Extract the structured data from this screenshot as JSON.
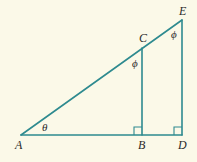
{
  "diagram": {
    "points": {
      "A": {
        "label": "A"
      },
      "B": {
        "label": "B"
      },
      "C": {
        "label": "C"
      },
      "D": {
        "label": "D"
      },
      "E": {
        "label": "E"
      }
    },
    "angles": {
      "theta": "θ",
      "phi_C": "ϕ",
      "phi_E": "ϕ"
    },
    "colors": {
      "line": "#2e8a8f",
      "background": "#fbf9e8",
      "text": "#2a2a2a"
    }
  }
}
